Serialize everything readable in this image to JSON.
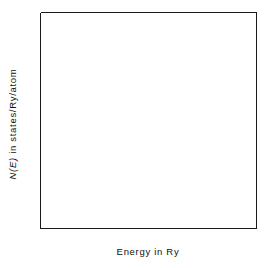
{
  "chart_data": {
    "type": "line",
    "title": "",
    "xlabel": "Energy in Ry",
    "ylabel": "N(E) in states/Ry/atom",
    "ylabel_italic_part": "N(E)",
    "ylabel_rest": " in states/Ry/atom",
    "xlim": [
      -0.2,
      1.0
    ],
    "ylim": [
      0,
      7.7
    ],
    "grid": false,
    "legend": "inline-annotations",
    "xticks_major": [
      -0.2,
      0.2,
      0.6,
      1.0
    ],
    "xticks_major_labels": [
      "-0.2",
      "0.2",
      "0.6",
      "1.0"
    ],
    "xticks_minor": [
      0.0,
      0.4,
      0.8
    ],
    "yticks_major": [
      0,
      2,
      4,
      6
    ],
    "yticks_major_labels": [
      "0",
      "2",
      "4",
      "6"
    ],
    "yticks_minor": [
      1,
      3,
      5,
      7
    ],
    "annotations": [
      {
        "text": "fcc",
        "x": 0.29,
        "y": 3.42,
        "series": "fcc"
      },
      {
        "text": "hcp",
        "x": 0.52,
        "y": 6.61,
        "series": "hcp"
      },
      {
        "text": "bcc",
        "x": 0.86,
        "y": 7.22,
        "series": "bcc"
      }
    ],
    "series": [
      {
        "name": "fcc",
        "style": "solid",
        "points": [
          [
            -0.2,
            0.0
          ],
          [
            -0.195,
            0.42
          ],
          [
            -0.19,
            0.62
          ],
          [
            -0.185,
            0.77
          ],
          [
            -0.178,
            0.93
          ],
          [
            -0.17,
            1.08
          ],
          [
            -0.16,
            1.24
          ],
          [
            -0.15,
            1.38
          ],
          [
            -0.135,
            1.56
          ],
          [
            -0.12,
            1.72
          ],
          [
            -0.1,
            1.9
          ],
          [
            -0.08,
            2.07
          ],
          [
            -0.06,
            2.22
          ],
          [
            -0.04,
            2.36
          ],
          [
            -0.02,
            2.49
          ],
          [
            0.0,
            2.61
          ],
          [
            0.025,
            2.75
          ],
          [
            0.05,
            2.88
          ],
          [
            0.075,
            3.0
          ],
          [
            0.1,
            3.12
          ],
          [
            0.125,
            3.23
          ],
          [
            0.15,
            3.34
          ],
          [
            0.175,
            3.44
          ],
          [
            0.2,
            3.54
          ],
          [
            0.225,
            3.64
          ],
          [
            0.25,
            3.74
          ],
          [
            0.27,
            3.83
          ],
          [
            0.29,
            3.92
          ],
          [
            0.305,
            4.02
          ],
          [
            0.315,
            4.14
          ],
          [
            0.325,
            4.26
          ],
          [
            0.335,
            4.34
          ],
          [
            0.345,
            4.26
          ],
          [
            0.352,
            4.12
          ],
          [
            0.36,
            4.03
          ],
          [
            0.368,
            4.1
          ],
          [
            0.375,
            4.21
          ],
          [
            0.382,
            4.12
          ],
          [
            0.39,
            4.01
          ],
          [
            0.398,
            4.12
          ],
          [
            0.405,
            4.27
          ],
          [
            0.412,
            4.44
          ],
          [
            0.42,
            4.6
          ],
          [
            0.43,
            4.78
          ],
          [
            0.44,
            4.9
          ],
          [
            0.452,
            4.98
          ],
          [
            0.465,
            5.02
          ],
          [
            0.478,
            4.98
          ],
          [
            0.49,
            4.88
          ],
          [
            0.5,
            4.74
          ],
          [
            0.51,
            4.6
          ],
          [
            0.52,
            4.48
          ],
          [
            0.53,
            4.4
          ],
          [
            0.54,
            4.38
          ],
          [
            0.55,
            4.48
          ],
          [
            0.558,
            4.62
          ],
          [
            0.566,
            4.78
          ],
          [
            0.574,
            4.92
          ],
          [
            0.582,
            5.02
          ],
          [
            0.59,
            5.1
          ],
          [
            0.598,
            5.04
          ],
          [
            0.606,
            4.92
          ],
          [
            0.614,
            4.8
          ],
          [
            0.622,
            4.73
          ],
          [
            0.63,
            4.82
          ],
          [
            0.64,
            5.0
          ],
          [
            0.65,
            5.18
          ],
          [
            0.66,
            5.33
          ],
          [
            0.672,
            5.44
          ],
          [
            0.684,
            5.5
          ],
          [
            0.696,
            5.48
          ],
          [
            0.708,
            5.4
          ],
          [
            0.72,
            5.34
          ],
          [
            0.732,
            5.32
          ],
          [
            0.744,
            5.35
          ],
          [
            0.756,
            5.4
          ],
          [
            0.77,
            5.44
          ],
          [
            0.785,
            5.46
          ],
          [
            0.8,
            5.45
          ],
          [
            0.815,
            5.44
          ],
          [
            0.83,
            5.46
          ],
          [
            0.845,
            5.52
          ],
          [
            0.86,
            5.6
          ],
          [
            0.875,
            5.68
          ],
          [
            0.89,
            5.78
          ],
          [
            0.905,
            5.88
          ],
          [
            0.92,
            5.96
          ],
          [
            0.935,
            6.04
          ],
          [
            0.95,
            6.12
          ],
          [
            0.965,
            6.22
          ],
          [
            0.98,
            6.34
          ],
          [
            0.99,
            6.44
          ],
          [
            1.0,
            6.56
          ]
        ]
      },
      {
        "name": "hcp",
        "style": "dashed",
        "points": [
          [
            0.295,
            3.95
          ],
          [
            0.302,
            4.1
          ],
          [
            0.308,
            4.32
          ],
          [
            0.312,
            4.48
          ],
          [
            0.316,
            4.35
          ],
          [
            0.32,
            4.52
          ],
          [
            0.325,
            4.76
          ],
          [
            0.33,
            4.96
          ],
          [
            0.335,
            5.14
          ],
          [
            0.34,
            5.22
          ],
          [
            0.346,
            5.1
          ],
          [
            0.352,
            4.9
          ],
          [
            0.358,
            4.72
          ],
          [
            0.364,
            4.86
          ],
          [
            0.37,
            5.04
          ],
          [
            0.376,
            4.92
          ],
          [
            0.382,
            4.72
          ],
          [
            0.388,
            4.52
          ],
          [
            0.394,
            4.36
          ],
          [
            0.4,
            4.24
          ],
          [
            0.406,
            4.14
          ],
          [
            0.412,
            4.02
          ],
          [
            0.418,
            3.92
          ],
          [
            0.424,
            4.02
          ],
          [
            0.43,
            3.92
          ],
          [
            0.436,
            4.0
          ],
          [
            0.442,
            3.9
          ],
          [
            0.448,
            3.98
          ],
          [
            0.454,
            3.88
          ],
          [
            0.46,
            3.96
          ],
          [
            0.466,
            3.86
          ],
          [
            0.472,
            3.98
          ],
          [
            0.478,
            4.14
          ],
          [
            0.484,
            4.06
          ],
          [
            0.49,
            3.94
          ],
          [
            0.496,
            4.1
          ],
          [
            0.502,
            4.4
          ],
          [
            0.508,
            4.75
          ],
          [
            0.514,
            5.1
          ],
          [
            0.52,
            5.44
          ],
          [
            0.526,
            5.76
          ],
          [
            0.532,
            6.02
          ],
          [
            0.538,
            6.18
          ],
          [
            0.544,
            6.06
          ],
          [
            0.55,
            5.82
          ],
          [
            0.556,
            5.56
          ],
          [
            0.562,
            5.32
          ],
          [
            0.568,
            5.16
          ],
          [
            0.574,
            5.3
          ],
          [
            0.58,
            5.2
          ],
          [
            0.586,
            5.05
          ],
          [
            0.592,
            4.96
          ],
          [
            0.6,
            5.06
          ],
          [
            0.608,
            5.26
          ],
          [
            0.616,
            5.52
          ],
          [
            0.624,
            5.8
          ],
          [
            0.632,
            6.05
          ],
          [
            0.64,
            6.24
          ],
          [
            0.648,
            6.34
          ],
          [
            0.656,
            6.22
          ],
          [
            0.664,
            6.0
          ],
          [
            0.672,
            5.8
          ],
          [
            0.68,
            5.66
          ],
          [
            0.688,
            5.58
          ],
          [
            0.696,
            5.62
          ],
          [
            0.704,
            5.58
          ],
          [
            0.712,
            5.44
          ],
          [
            0.72,
            5.26
          ],
          [
            0.73,
            5.06
          ],
          [
            0.74,
            4.88
          ],
          [
            0.752,
            4.74
          ],
          [
            0.764,
            4.68
          ],
          [
            0.776,
            4.72
          ],
          [
            0.788,
            4.84
          ],
          [
            0.8,
            5.0
          ],
          [
            0.812,
            5.2
          ],
          [
            0.824,
            5.42
          ],
          [
            0.836,
            5.62
          ],
          [
            0.848,
            5.8
          ],
          [
            0.86,
            5.95
          ],
          [
            0.872,
            6.08
          ],
          [
            0.884,
            6.18
          ],
          [
            0.896,
            6.24
          ],
          [
            0.908,
            6.26
          ],
          [
            0.92,
            6.22
          ],
          [
            0.932,
            6.14
          ],
          [
            0.944,
            6.08
          ],
          [
            0.956,
            6.06
          ],
          [
            0.968,
            6.1
          ],
          [
            0.98,
            6.14
          ],
          [
            0.99,
            6.14
          ],
          [
            1.0,
            6.1
          ]
        ]
      },
      {
        "name": "bcc",
        "style": "dotted",
        "points": [
          [
            0.3,
            3.92
          ],
          [
            0.312,
            4.02
          ],
          [
            0.324,
            4.1
          ],
          [
            0.336,
            4.18
          ],
          [
            0.348,
            4.22
          ],
          [
            0.36,
            4.3
          ],
          [
            0.372,
            4.38
          ],
          [
            0.384,
            4.46
          ],
          [
            0.396,
            4.54
          ],
          [
            0.408,
            4.6
          ],
          [
            0.42,
            4.66
          ],
          [
            0.434,
            4.7
          ],
          [
            0.448,
            4.72
          ],
          [
            0.462,
            4.72
          ],
          [
            0.476,
            4.7
          ],
          [
            0.49,
            4.68
          ],
          [
            0.504,
            4.7
          ],
          [
            0.518,
            4.76
          ],
          [
            0.532,
            4.84
          ],
          [
            0.546,
            4.94
          ],
          [
            0.56,
            5.04
          ],
          [
            0.574,
            5.12
          ],
          [
            0.588,
            5.18
          ],
          [
            0.602,
            5.22
          ],
          [
            0.616,
            5.26
          ],
          [
            0.63,
            5.3
          ],
          [
            0.644,
            5.34
          ],
          [
            0.658,
            5.38
          ],
          [
            0.672,
            5.42
          ],
          [
            0.686,
            5.48
          ],
          [
            0.7,
            5.56
          ],
          [
            0.714,
            5.66
          ],
          [
            0.728,
            5.78
          ],
          [
            0.742,
            5.92
          ],
          [
            0.756,
            6.08
          ],
          [
            0.77,
            6.26
          ],
          [
            0.784,
            6.44
          ],
          [
            0.796,
            6.6
          ],
          [
            0.806,
            6.72
          ],
          [
            0.816,
            6.78
          ],
          [
            0.826,
            6.72
          ],
          [
            0.838,
            6.58
          ],
          [
            0.85,
            6.42
          ],
          [
            0.862,
            6.26
          ],
          [
            0.874,
            6.12
          ],
          [
            0.886,
            6.02
          ],
          [
            0.898,
            5.96
          ],
          [
            0.906,
            6.04
          ],
          [
            0.914,
            6.12
          ],
          [
            0.922,
            6.04
          ],
          [
            0.93,
            6.12
          ],
          [
            0.94,
            6.18
          ],
          [
            0.95,
            6.12
          ],
          [
            0.96,
            6.18
          ],
          [
            0.97,
            6.2
          ],
          [
            0.98,
            6.18
          ],
          [
            0.99,
            6.2
          ],
          [
            1.0,
            6.24
          ]
        ]
      }
    ]
  }
}
